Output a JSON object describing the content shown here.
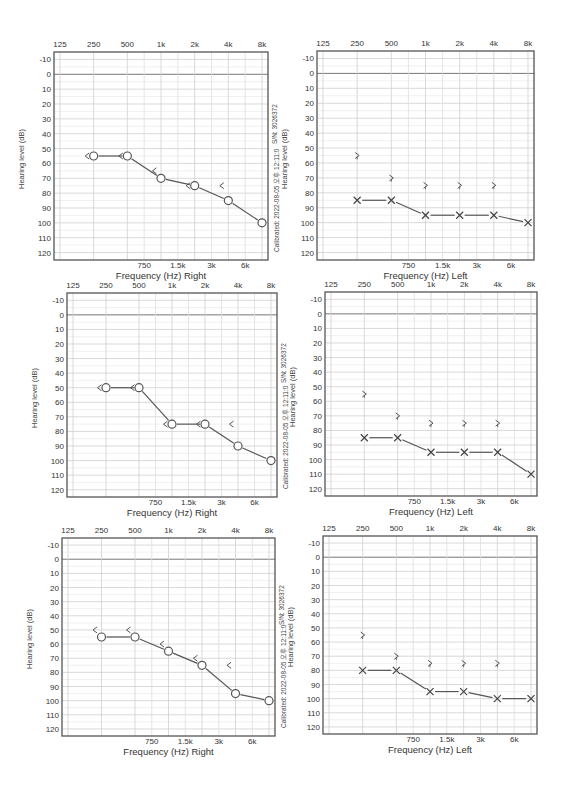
{
  "common": {
    "top_ticks": [
      "125",
      "250",
      "500",
      "1k",
      "2k",
      "4k",
      "8k"
    ],
    "bottom_ticks": [
      "750",
      "1.5k",
      "3k",
      "6k"
    ],
    "y_ticks": [
      -10,
      0,
      10,
      20,
      30,
      40,
      50,
      60,
      70,
      80,
      90,
      100,
      110,
      120
    ],
    "ylabel": "Hearing level (dB)",
    "serial": "S/N: 3026372",
    "calibrated": "Calibrated: 2022-08-05 오후 12:11:0"
  },
  "chart_data": [
    {
      "type": "line",
      "title": "Audiogram 1 - Right",
      "xlabel": "Frequency (Hz) Right",
      "ylabel": "Hearing level (dB)",
      "ylim": [
        -10,
        120
      ],
      "y_inverted": true,
      "grid": true,
      "x": [
        "250",
        "500",
        "1k",
        "2k",
        "4k",
        "8k"
      ],
      "series": [
        {
          "name": "Right air conduction (O)",
          "values": [
            55,
            55,
            70,
            75,
            85,
            100
          ]
        },
        {
          "name": "Right bone conduction (<)",
          "values": [
            55,
            55,
            65,
            75,
            75,
            null
          ]
        }
      ]
    },
    {
      "type": "line",
      "title": "Audiogram 1 - Left",
      "xlabel": "Frequency (Hz) Left",
      "ylabel": "Hearing level (dB)",
      "ylim": [
        -10,
        120
      ],
      "y_inverted": true,
      "grid": true,
      "x": [
        "250",
        "500",
        "1k",
        "2k",
        "4k",
        "8k"
      ],
      "series": [
        {
          "name": "Left air conduction (X)",
          "values": [
            85,
            85,
            95,
            95,
            95,
            100
          ]
        },
        {
          "name": "Left bone conduction (>)",
          "values": [
            55,
            70,
            75,
            75,
            75,
            null
          ]
        }
      ]
    },
    {
      "type": "line",
      "title": "Audiogram 2 - Right",
      "xlabel": "Frequency (Hz) Right",
      "ylabel": "Hearing level (dB)",
      "ylim": [
        -10,
        120
      ],
      "y_inverted": true,
      "grid": true,
      "x": [
        "250",
        "500",
        "1k",
        "2k",
        "4k",
        "8k"
      ],
      "series": [
        {
          "name": "Right air conduction (O)",
          "values": [
            50,
            50,
            75,
            75,
            90,
            100
          ]
        },
        {
          "name": "Right bone conduction (<)",
          "values": [
            50,
            50,
            75,
            75,
            75,
            null
          ]
        }
      ]
    },
    {
      "type": "line",
      "title": "Audiogram 2 - Left",
      "xlabel": "Frequency (Hz) Left",
      "ylabel": "Hearing level (dB)",
      "ylim": [
        -10,
        120
      ],
      "y_inverted": true,
      "grid": true,
      "x": [
        "250",
        "500",
        "1k",
        "2k",
        "4k",
        "8k"
      ],
      "series": [
        {
          "name": "Left air conduction (X)",
          "values": [
            85,
            85,
            95,
            95,
            95,
            110
          ]
        },
        {
          "name": "Left bone conduction (>)",
          "values": [
            55,
            70,
            75,
            75,
            75,
            null
          ]
        }
      ]
    },
    {
      "type": "line",
      "title": "Audiogram 3 - Right",
      "xlabel": "Frequency (Hz) Right",
      "ylabel": "Hearing level (dB)",
      "ylim": [
        -10,
        120
      ],
      "y_inverted": true,
      "grid": true,
      "x": [
        "250",
        "500",
        "1k",
        "2k",
        "4k",
        "8k"
      ],
      "series": [
        {
          "name": "Right air conduction (O)",
          "values": [
            55,
            55,
            65,
            75,
            95,
            100
          ]
        },
        {
          "name": "Right bone conduction (<)",
          "values": [
            50,
            50,
            60,
            70,
            75,
            null
          ]
        }
      ]
    },
    {
      "type": "line",
      "title": "Audiogram 3 - Left",
      "xlabel": "Frequency (Hz) Left",
      "ylabel": "Hearing level (dB)",
      "ylim": [
        -10,
        120
      ],
      "y_inverted": true,
      "grid": true,
      "x": [
        "250",
        "500",
        "1k",
        "2k",
        "4k",
        "8k"
      ],
      "series": [
        {
          "name": "Left air conduction (X)",
          "values": [
            80,
            80,
            95,
            95,
            100,
            100
          ]
        },
        {
          "name": "Left bone conduction (>)",
          "values": [
            55,
            70,
            75,
            75,
            75,
            null
          ]
        }
      ]
    }
  ],
  "layout": [
    {
      "ear": "right",
      "x": 54,
      "y": 52,
      "w": 214,
      "h": 208,
      "side": true
    },
    {
      "ear": "left",
      "x": 317,
      "y": 51,
      "w": 217,
      "h": 209,
      "side": false
    },
    {
      "ear": "right",
      "x": 67,
      "y": 293,
      "w": 210,
      "h": 204,
      "side": true
    },
    {
      "ear": "left",
      "x": 325,
      "y": 292,
      "w": 212,
      "h": 204,
      "side": false
    },
    {
      "ear": "right",
      "x": 62,
      "y": 538,
      "w": 213,
      "h": 198,
      "side": true
    },
    {
      "ear": "left",
      "x": 323,
      "y": 536,
      "w": 214,
      "h": 198,
      "side": false
    }
  ]
}
